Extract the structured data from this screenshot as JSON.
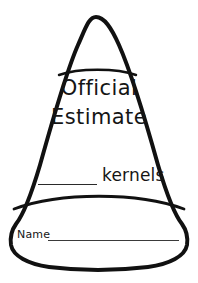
{
  "page": {
    "kind": "candy-corn-estimation-worksheet",
    "background_color": "#ffffff",
    "outline_color": "#111111",
    "text_color": "#151515",
    "rule_color": "#2a2a2a"
  },
  "shape": {
    "name": "candy-corn",
    "outline_width_px": 4,
    "bands": [
      {
        "name": "tip-band",
        "label": ""
      },
      {
        "name": "middle-band",
        "label": ""
      },
      {
        "name": "bottom-band",
        "label": ""
      }
    ]
  },
  "title": {
    "line1": "Official",
    "line2": "Estimate"
  },
  "estimate_field": {
    "blank_label": "",
    "unit_label": "kernels"
  },
  "name_field": {
    "label": "Name",
    "value": ""
  }
}
